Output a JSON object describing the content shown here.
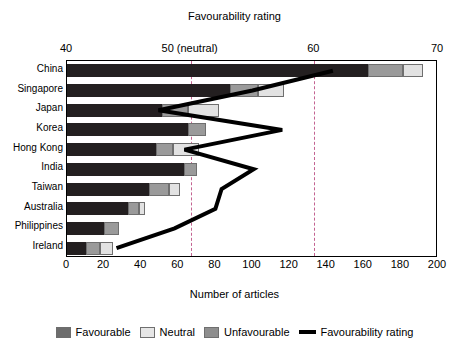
{
  "chart_data": {
    "type": "bar",
    "title": "Favourability rating",
    "xlabel": "Number of articles",
    "xlabel_top": "Favourability rating",
    "ylabel": "",
    "orientation": "horizontal",
    "stacked": true,
    "grid": false,
    "legend_position": "bottom",
    "categories": [
      "China",
      "Singapore",
      "Japan",
      "Korea",
      "Hong Kong",
      "India",
      "Taiwan",
      "Australia",
      "Philippines",
      "Ireland"
    ],
    "series": [
      {
        "name": "Favourable",
        "color": "#231f20",
        "values": [
          162,
          88,
          51,
          65,
          48,
          63,
          44,
          33,
          20,
          10
        ]
      },
      {
        "name": "Neutral",
        "color": "#e2e2e2",
        "values": [
          11,
          14,
          17,
          0,
          14,
          0,
          6,
          3,
          0,
          7
        ]
      },
      {
        "name": "Unfavourable",
        "color": "#9a9a9a",
        "values": [
          19,
          15,
          14,
          10,
          9,
          7,
          11,
          6,
          8,
          8
        ]
      }
    ],
    "line_series": {
      "name": "Favourability rating",
      "color": "#000000",
      "values": [
        61.5,
        55.0,
        47.4,
        57.4,
        49.5,
        55.1,
        52.5,
        52.0,
        48.7,
        44.0
      ],
      "axis": "top"
    },
    "bottom_axis": {
      "label": "Number of articles",
      "ticks": [
        0,
        20,
        40,
        60,
        80,
        100,
        120,
        140,
        160,
        180,
        200
      ],
      "min": 0,
      "max": 200
    },
    "top_axis": {
      "label": "Favourability rating",
      "ticks": [
        "40",
        "50 (neutral)",
        "60",
        "70"
      ],
      "tick_values": [
        40,
        50,
        60,
        70
      ],
      "min": 40,
      "max": 70
    },
    "reference_lines": [
      {
        "value": 50,
        "style": "dashed"
      },
      {
        "value": 60,
        "style": "dashed"
      }
    ]
  },
  "legend": {
    "items": [
      {
        "label": "Favourable",
        "type": "swatch",
        "swatch": "fav"
      },
      {
        "label": "Neutral",
        "type": "swatch",
        "swatch": "neu"
      },
      {
        "label": "Unfavourable",
        "type": "swatch",
        "swatch": "unf"
      },
      {
        "label": "Favourability rating",
        "type": "line",
        "swatch": "line"
      }
    ]
  }
}
